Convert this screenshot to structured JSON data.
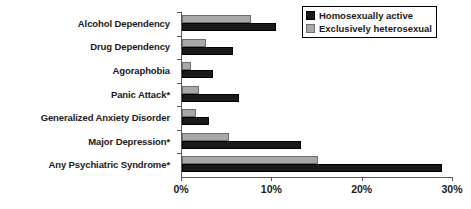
{
  "chart_data": {
    "type": "bar",
    "orientation": "horizontal",
    "title": "",
    "xlabel": "",
    "ylabel": "",
    "xlim": [
      0,
      30
    ],
    "xticks": [
      0,
      10,
      20,
      30
    ],
    "xtick_labels": [
      "0%",
      "10%",
      "20%",
      "30%"
    ],
    "grid": false,
    "legend_position": "top-right",
    "categories": [
      "Alcohol Dependency",
      "Drug Dependency",
      "Agoraphobia",
      "Panic Attack*",
      "Generalized Anxiety Disorder",
      "Major Depression*",
      "Any Psychiatric Syndrome*"
    ],
    "series": [
      {
        "name": "Homosexually active",
        "color": "#1a1a1a",
        "values": [
          10.4,
          5.7,
          3.4,
          6.3,
          3.0,
          13.2,
          28.8
        ]
      },
      {
        "name": "Exclusively heterosexual",
        "color": "#a8a8a8",
        "values": [
          7.6,
          2.7,
          1.0,
          1.9,
          1.6,
          5.2,
          15.1
        ]
      }
    ]
  },
  "legend": {
    "items": [
      {
        "label": "Homosexually active",
        "swatch": "black"
      },
      {
        "label": "Exclusively heterosexual",
        "swatch": "gray"
      }
    ]
  },
  "colors": {
    "series_black": "#1a1a1a",
    "series_gray": "#a8a8a8",
    "axis": "#5a5a5a",
    "background": "#ffffff"
  }
}
